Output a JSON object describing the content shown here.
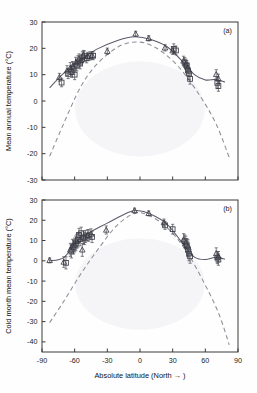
{
  "figure": {
    "xlabel": "Absolute latitude (North → )",
    "panels": [
      {
        "key": "a",
        "label": "(a)",
        "ylabel": "Mean annual temperature (°C)"
      },
      {
        "key": "b",
        "label": "(b)",
        "ylabel": "Cold month mean temperature (°C)"
      }
    ],
    "xticks": [
      "-90",
      "-60",
      "-30",
      "0",
      "30",
      "60",
      "90"
    ],
    "yticks_a": [
      "30",
      "20",
      "10",
      "0",
      "-10",
      "-20",
      "-30"
    ],
    "yticks_b": [
      "30",
      "20",
      "10",
      "0",
      "-10",
      "-20",
      "-30",
      "-40"
    ],
    "colors": {
      "axis": "#3a3a3a",
      "solid_curve": "#5a5a6a",
      "dashed_curve": "#8d8d98",
      "marker": "#3b3b46",
      "background": "#fefefe"
    }
  },
  "chart_data": [
    {
      "type": "scatter",
      "panel": "(a)",
      "title": "",
      "xlabel": "Absolute latitude (North → )",
      "ylabel": "Mean annual temperature (°C)",
      "xlim": [
        -90,
        90
      ],
      "ylim": [
        -30,
        30
      ],
      "xticks": [
        -90,
        -60,
        -30,
        0,
        30,
        60,
        90
      ],
      "yticks": [
        -30,
        -20,
        -10,
        0,
        10,
        20,
        30
      ],
      "grid": false,
      "legend": "none",
      "series": [
        {
          "name": "squares",
          "marker": "square",
          "points": [
            {
              "x": -72,
              "y": 7.0,
              "err": 1.6
            },
            {
              "x": -66,
              "y": 10.3,
              "err": 1.8
            },
            {
              "x": -63,
              "y": 11.0,
              "err": 2.0
            },
            {
              "x": -61,
              "y": 12.3,
              "err": 2.2
            },
            {
              "x": -60,
              "y": 10.0,
              "err": 1.9
            },
            {
              "x": -58,
              "y": 13.4,
              "err": 2.0
            },
            {
              "x": -57,
              "y": 15.0,
              "err": 2.2
            },
            {
              "x": -55,
              "y": 14.2,
              "err": 2.0
            },
            {
              "x": -53,
              "y": 16.6,
              "err": 2.1
            },
            {
              "x": -51,
              "y": 17.0,
              "err": 2.0
            },
            {
              "x": -49,
              "y": 16.3,
              "err": 1.8
            },
            {
              "x": -46,
              "y": 17.1,
              "err": 1.6
            },
            {
              "x": -43,
              "y": 17.2,
              "err": 1.5
            },
            {
              "x": 31,
              "y": 19.8,
              "err": 1.9
            },
            {
              "x": 33,
              "y": 19.2,
              "err": 1.7
            },
            {
              "x": 41,
              "y": 14.6,
              "err": 1.9
            },
            {
              "x": 43,
              "y": 13.3,
              "err": 2.0
            },
            {
              "x": 44,
              "y": 11.6,
              "err": 2.1
            },
            {
              "x": 45,
              "y": 10.4,
              "err": 2.2
            },
            {
              "x": 46,
              "y": 8.4,
              "err": 2.0
            },
            {
              "x": 71,
              "y": 6.9,
              "err": 2.2
            },
            {
              "x": 72,
              "y": 5.7,
              "err": 2.0
            }
          ]
        },
        {
          "name": "triangles",
          "marker": "triangle",
          "points": [
            {
              "x": -74,
              "y": 9.0,
              "err": 1.5
            },
            {
              "x": -67,
              "y": 11.5,
              "err": 1.9
            },
            {
              "x": -64,
              "y": 12.6,
              "err": 2.0
            },
            {
              "x": -62,
              "y": 13.1,
              "err": 1.9
            },
            {
              "x": -59,
              "y": 14.6,
              "err": 2.0
            },
            {
              "x": -56,
              "y": 16.0,
              "err": 1.9
            },
            {
              "x": -54,
              "y": 15.4,
              "err": 1.8
            },
            {
              "x": -52,
              "y": 17.4,
              "err": 1.8
            },
            {
              "x": -48,
              "y": 16.9,
              "err": 1.6
            },
            {
              "x": -44,
              "y": 17.3,
              "err": 1.5
            },
            {
              "x": -30,
              "y": 18.9,
              "err": 1.2
            },
            {
              "x": -4,
              "y": 25.5,
              "err": 1.0
            },
            {
              "x": 8,
              "y": 23.8,
              "err": 1.0
            },
            {
              "x": 23,
              "y": 20.2,
              "err": 1.2
            },
            {
              "x": 30,
              "y": 19.1,
              "err": 1.4
            },
            {
              "x": 40,
              "y": 15.2,
              "err": 1.8
            },
            {
              "x": 42,
              "y": 14.0,
              "err": 1.9
            },
            {
              "x": 44,
              "y": 12.6,
              "err": 2.0
            },
            {
              "x": 70,
              "y": 10.1,
              "err": 1.8
            },
            {
              "x": 72,
              "y": 8.4,
              "err": 1.8
            }
          ]
        },
        {
          "name": "solid fitted curve",
          "type": "line",
          "style": "solid",
          "points": [
            {
              "x": -83,
              "y": 5.0
            },
            {
              "x": -70,
              "y": 10.6
            },
            {
              "x": -55,
              "y": 15.5
            },
            {
              "x": -40,
              "y": 19.6
            },
            {
              "x": -20,
              "y": 23.1
            },
            {
              "x": -5,
              "y": 24.4
            },
            {
              "x": 10,
              "y": 23.4
            },
            {
              "x": 25,
              "y": 20.6
            },
            {
              "x": 40,
              "y": 14.6
            },
            {
              "x": 50,
              "y": 10.0
            },
            {
              "x": 60,
              "y": 8.0
            },
            {
              "x": 70,
              "y": 8.2
            },
            {
              "x": 78,
              "y": 7.2
            }
          ]
        },
        {
          "name": "dashed reference curve",
          "type": "line",
          "style": "dashed",
          "points": [
            {
              "x": -83,
              "y": -21.0
            },
            {
              "x": -70,
              "y": -8.5
            },
            {
              "x": -55,
              "y": 5.0
            },
            {
              "x": -40,
              "y": 13.8
            },
            {
              "x": -20,
              "y": 20.6
            },
            {
              "x": -2,
              "y": 22.4
            },
            {
              "x": 15,
              "y": 20.1
            },
            {
              "x": 35,
              "y": 13.2
            },
            {
              "x": 55,
              "y": 2.0
            },
            {
              "x": 70,
              "y": -8.8
            },
            {
              "x": 82,
              "y": -21.5
            }
          ]
        }
      ]
    },
    {
      "type": "scatter",
      "panel": "(b)",
      "title": "",
      "xlabel": "Absolute latitude (North → )",
      "ylabel": "Cold month mean temperature (°C)",
      "xlim": [
        -90,
        90
      ],
      "ylim": [
        -45,
        30
      ],
      "xticks": [
        -90,
        -60,
        -30,
        0,
        30,
        60,
        90
      ],
      "yticks": [
        -40,
        -30,
        -20,
        -10,
        0,
        10,
        20,
        30
      ],
      "grid": false,
      "legend": "none",
      "series": [
        {
          "name": "squares",
          "marker": "square",
          "points": [
            {
              "x": -68,
              "y": -1.0,
              "err": 3.0
            },
            {
              "x": -63,
              "y": 4.6,
              "err": 3.2
            },
            {
              "x": -61,
              "y": 6.8,
              "err": 3.4
            },
            {
              "x": -59,
              "y": 8.6,
              "err": 3.6
            },
            {
              "x": -57,
              "y": 10.2,
              "err": 3.4
            },
            {
              "x": -56,
              "y": 12.8,
              "err": 3.2
            },
            {
              "x": -54,
              "y": 13.6,
              "err": 3.0
            },
            {
              "x": -52,
              "y": 11.5,
              "err": 3.2
            },
            {
              "x": -50,
              "y": 12.0,
              "err": 3.0
            },
            {
              "x": -47,
              "y": 12.5,
              "err": 2.8
            },
            {
              "x": -44,
              "y": 11.8,
              "err": 2.8
            },
            {
              "x": 23,
              "y": 17.5,
              "err": 2.0
            },
            {
              "x": 30,
              "y": 15.6,
              "err": 2.4
            },
            {
              "x": 41,
              "y": 9.6,
              "err": 3.2
            },
            {
              "x": 43,
              "y": 7.6,
              "err": 3.4
            },
            {
              "x": 44,
              "y": 5.6,
              "err": 3.6
            },
            {
              "x": 45,
              "y": 3.6,
              "err": 3.6
            },
            {
              "x": 46,
              "y": 2.2,
              "err": 3.4
            },
            {
              "x": 71,
              "y": 1.6,
              "err": 3.0
            },
            {
              "x": 72,
              "y": 0.6,
              "err": 2.8
            }
          ]
        },
        {
          "name": "triangles",
          "marker": "triangle",
          "points": [
            {
              "x": -83,
              "y": 0.2,
              "err": 1.2
            },
            {
              "x": -70,
              "y": -0.6,
              "err": 2.6
            },
            {
              "x": -64,
              "y": 5.4,
              "err": 3.2
            },
            {
              "x": -62,
              "y": 7.4,
              "err": 3.2
            },
            {
              "x": -60,
              "y": 7.8,
              "err": 3.4
            },
            {
              "x": -58,
              "y": 9.6,
              "err": 3.4
            },
            {
              "x": -55,
              "y": 10.6,
              "err": 3.2
            },
            {
              "x": -53,
              "y": 5.4,
              "err": 3.2
            },
            {
              "x": -51,
              "y": 11.0,
              "err": 3.0
            },
            {
              "x": -48,
              "y": 12.6,
              "err": 2.8
            },
            {
              "x": -45,
              "y": 13.2,
              "err": 2.6
            },
            {
              "x": -31,
              "y": 15.2,
              "err": 2.0
            },
            {
              "x": -5,
              "y": 24.8,
              "err": 1.2
            },
            {
              "x": 8,
              "y": 23.4,
              "err": 1.2
            },
            {
              "x": 22,
              "y": 18.8,
              "err": 1.8
            },
            {
              "x": 40,
              "y": 10.4,
              "err": 3.0
            },
            {
              "x": 42,
              "y": 9.0,
              "err": 3.2
            },
            {
              "x": 44,
              "y": 7.0,
              "err": 3.4
            },
            {
              "x": 70,
              "y": 3.6,
              "err": 2.8
            },
            {
              "x": 72,
              "y": 2.0,
              "err": 2.6
            }
          ]
        },
        {
          "name": "solid fitted curve",
          "type": "line",
          "style": "solid",
          "points": [
            {
              "x": -83,
              "y": 0.0
            },
            {
              "x": -70,
              "y": 1.6
            },
            {
              "x": -58,
              "y": 9.6
            },
            {
              "x": -45,
              "y": 14.4
            },
            {
              "x": -30,
              "y": 18.6
            },
            {
              "x": -12,
              "y": 23.6
            },
            {
              "x": -3,
              "y": 24.8
            },
            {
              "x": 10,
              "y": 23.0
            },
            {
              "x": 25,
              "y": 18.0
            },
            {
              "x": 40,
              "y": 8.0
            },
            {
              "x": 50,
              "y": 1.8
            },
            {
              "x": 60,
              "y": 0.6
            },
            {
              "x": 70,
              "y": 1.8
            },
            {
              "x": 78,
              "y": 0.8
            }
          ]
        },
        {
          "name": "dashed reference curve",
          "type": "line",
          "style": "dashed",
          "points": [
            {
              "x": -83,
              "y": -30.5
            },
            {
              "x": -70,
              "y": -20.0
            },
            {
              "x": -55,
              "y": -7.0
            },
            {
              "x": -40,
              "y": 4.6
            },
            {
              "x": -22,
              "y": 17.0
            },
            {
              "x": -5,
              "y": 23.4
            },
            {
              "x": 8,
              "y": 22.4
            },
            {
              "x": 25,
              "y": 16.4
            },
            {
              "x": 42,
              "y": 5.2
            },
            {
              "x": 58,
              "y": -10.0
            },
            {
              "x": 72,
              "y": -25.6
            },
            {
              "x": 82,
              "y": -41.5
            }
          ]
        }
      ]
    }
  ]
}
